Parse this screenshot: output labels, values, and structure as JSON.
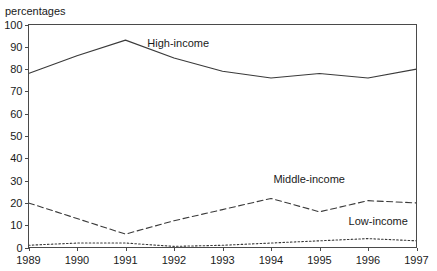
{
  "axis_caption": "percentages",
  "chart_data": {
    "type": "line",
    "title": "",
    "xlabel": "",
    "ylabel": "percentages",
    "x": [
      1989,
      1990,
      1991,
      1992,
      1993,
      1994,
      1995,
      1996,
      1997
    ],
    "xticklabels": [
      "1989",
      "1990",
      "1991",
      "1992",
      "1993",
      "1994",
      "1995",
      "1996",
      "1997"
    ],
    "yticklabels": [
      "0",
      "10",
      "20",
      "30",
      "40",
      "50",
      "60",
      "70",
      "80",
      "90",
      "100"
    ],
    "yticks": [
      0,
      10,
      20,
      30,
      40,
      50,
      60,
      70,
      80,
      90,
      100
    ],
    "ylim": [
      0,
      100
    ],
    "xlim": [
      1989,
      1997
    ],
    "grid": false,
    "legend_position": "inline-labels",
    "series": [
      {
        "name": "High-income",
        "style": "solid",
        "color": "#3a3a3a",
        "values": [
          78,
          86,
          93,
          85,
          79,
          76,
          78,
          76,
          80
        ],
        "label_x": 1991.45,
        "label_y": 90
      },
      {
        "name": "Middle-income",
        "style": "dashed",
        "color": "#3a3a3a",
        "values": [
          20,
          13,
          6,
          12,
          17,
          22,
          16,
          21,
          20
        ],
        "label_x": 1994.05,
        "label_y": 29
      },
      {
        "name": "Low-income",
        "style": "dotted",
        "color": "#3a3a3a",
        "values": [
          1,
          2,
          2,
          0.5,
          1,
          2,
          3,
          4,
          3
        ],
        "label_x": 1995.6,
        "label_y": 10
      }
    ]
  }
}
